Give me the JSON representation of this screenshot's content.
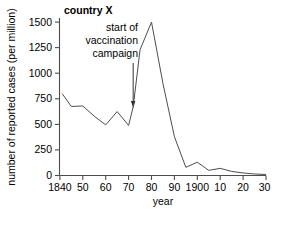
{
  "chart_data": {
    "type": "line",
    "title": "country X",
    "xlabel": "year",
    "ylabel": "number of reported cases (per million)",
    "xlim": [
      1840,
      1930
    ],
    "ylim": [
      0,
      1550
    ],
    "grid": false,
    "legend": "none",
    "x_tick_values": [
      1840,
      1850,
      1860,
      1870,
      1880,
      1890,
      1900,
      1910,
      1920,
      1930
    ],
    "x_tick_labels": [
      "1840",
      "50",
      "60",
      "70",
      "80",
      "90",
      "1900",
      "10",
      "20",
      "30"
    ],
    "y_tick_values": [
      0,
      250,
      500,
      750,
      1000,
      1250,
      1500
    ],
    "y_tick_labels": [
      "0",
      "250",
      "500",
      "750",
      "1000",
      "1250",
      "1500"
    ],
    "series": [
      {
        "name": "reported cases per million",
        "x": [
          1841,
          1845,
          1850,
          1855,
          1860,
          1865,
          1870,
          1872,
          1875,
          1880,
          1885,
          1890,
          1895,
          1900,
          1905,
          1910,
          1915,
          1920,
          1925,
          1930
        ],
        "values": [
          800,
          675,
          680,
          580,
          495,
          625,
          490,
          670,
          1230,
          1500,
          900,
          380,
          80,
          130,
          50,
          70,
          40,
          25,
          15,
          10
        ]
      }
    ],
    "annotations": [
      {
        "name": "vaccination-annotation",
        "lines": [
          "start of",
          "vaccination",
          "campaign"
        ],
        "points_to_year": 1872,
        "points_to_value": 670
      }
    ]
  }
}
